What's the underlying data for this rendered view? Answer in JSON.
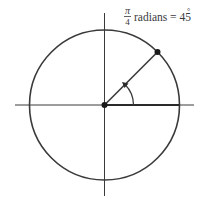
{
  "diagram": {
    "type": "unit-circle-angle",
    "center": [
      104.5,
      105
    ],
    "radius": 75,
    "angle_degrees": 45,
    "label": {
      "numerator": "π",
      "denominator": "4",
      "text": "radians = 45",
      "degree_symbol": "°"
    },
    "colors": {
      "stroke": "#3a3a3a",
      "background": "#ffffff"
    }
  }
}
